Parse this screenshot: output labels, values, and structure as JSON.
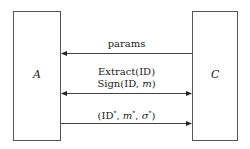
{
  "diagram": {
    "entities": [
      {
        "id": "A",
        "label": "A"
      },
      {
        "id": "C",
        "label": "C"
      }
    ],
    "messages": [
      {
        "label": "params",
        "from": "C",
        "to": "A",
        "direction": "left"
      },
      {
        "label_line1": "Extract(ID)",
        "label_line2_prefix": "Sign(ID, ",
        "label_line2_var": "m",
        "label_line2_suffix": ")",
        "direction": "both"
      },
      {
        "label_prefix": "(ID",
        "label_sup1": "*",
        "label_sep1": ", ",
        "label_m": "m",
        "label_sup2": "*",
        "label_sep2": ", ",
        "label_sigma": "σ",
        "label_sup3": "*",
        "label_suffix": ")",
        "from": "A",
        "to": "C",
        "direction": "right"
      }
    ],
    "line_color": "#444444"
  }
}
